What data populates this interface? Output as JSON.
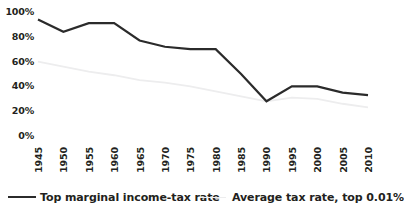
{
  "chart_data": {
    "type": "line",
    "title": "",
    "subtitle": "",
    "xlabel": "",
    "ylabel": "",
    "grid": false,
    "legend_position": "bottom",
    "x": [
      1945,
      1950,
      1955,
      1960,
      1965,
      1970,
      1975,
      1980,
      1985,
      1990,
      1995,
      2000,
      2005,
      2010
    ],
    "categories": [
      "1945",
      "1950",
      "1955",
      "1960",
      "1965",
      "1970",
      "1975",
      "1980",
      "1985",
      "1990",
      "1995",
      "2000",
      "2005",
      "2010"
    ],
    "xlim": [
      1945,
      2010
    ],
    "ylim": [
      0,
      100
    ],
    "yticks": [
      0,
      20,
      40,
      60,
      80,
      100
    ],
    "ytick_labels": [
      "0%",
      "20%",
      "40%",
      "60%",
      "80%",
      "100%"
    ],
    "series": [
      {
        "name": "Top marginal income-tax rate",
        "color": "#2b2b2b",
        "width": 2.2,
        "values": [
          94,
          84,
          91,
          91,
          77,
          72,
          70,
          70,
          50,
          28,
          40,
          40,
          35,
          33
        ]
      },
      {
        "name": "Average tax rate, top 0.01%",
        "color": "#ededee",
        "width": 1.8,
        "values": [
          60,
          56,
          52,
          49,
          45,
          43,
          40,
          36,
          32,
          28,
          31,
          30,
          26,
          23
        ]
      }
    ]
  },
  "legend": {
    "items": [
      {
        "label": "Top marginal income-tax rate"
      },
      {
        "label": "Average tax rate, top 0.01%"
      }
    ]
  },
  "axes": {
    "y_tick_labels": [
      "100%",
      "80%",
      "60%",
      "40%",
      "20%",
      "0%"
    ],
    "x_tick_labels": [
      "1945",
      "1950",
      "1955",
      "1960",
      "1965",
      "1970",
      "1975",
      "1980",
      "1985",
      "1990",
      "1995",
      "2000",
      "2005",
      "2010"
    ]
  }
}
